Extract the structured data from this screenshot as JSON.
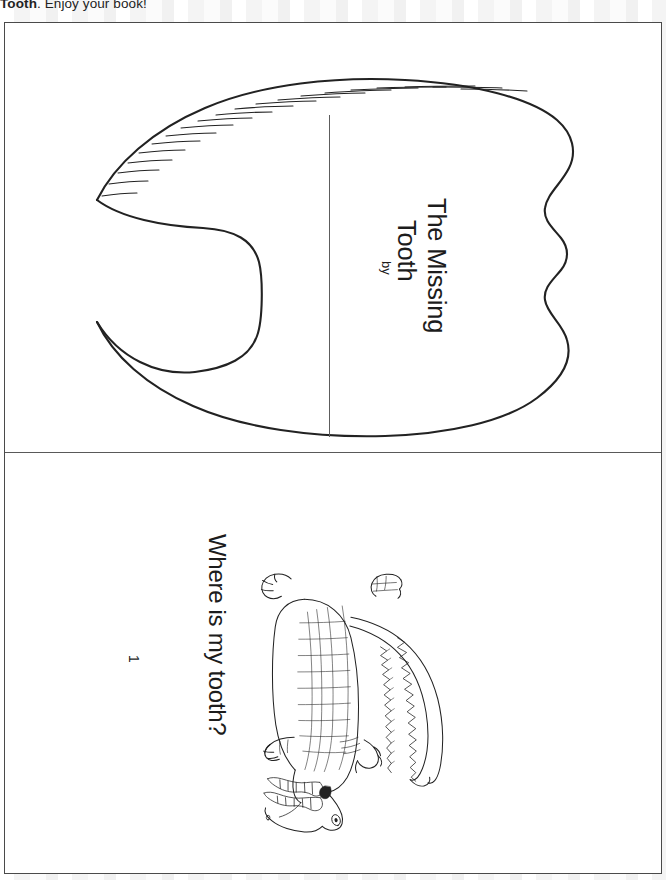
{
  "document": {
    "type": "printable-worksheet",
    "instruction_text_visible": "Tooth. Enjoy your book!",
    "instruction_bold_fragment": "Tooth",
    "instruction_rest": ". Enjoy your book!"
  },
  "colors": {
    "ink": "#1c1c1c",
    "line_art": "#222222",
    "sheet_border": "#4a4a4a",
    "divider": "#595959",
    "paper": "#ffffff",
    "backdrop_band": "#f2f2f2"
  },
  "panels": [
    {
      "name": "cover",
      "title_line_1": "The Missing",
      "title_line_2": "Tooth",
      "byline_label": "by",
      "artwork": "tooth-outline",
      "has_vertical_rule": true
    },
    {
      "name": "page-1",
      "caption": "Where is my tooth?",
      "page_number": "1",
      "artwork": "alligator-line-drawing"
    }
  ],
  "icons": {
    "tooth": "tooth-icon",
    "alligator": "alligator-icon"
  }
}
